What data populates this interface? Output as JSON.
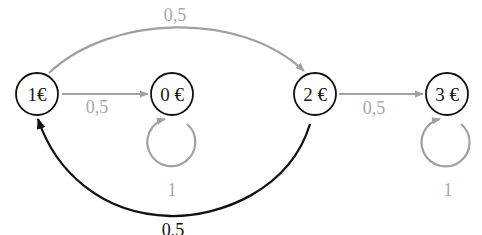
{
  "diagram": {
    "type": "markov-chain",
    "colors": {
      "node_stroke": "#111111",
      "edge_gray": "#a0a0a0",
      "edge_dark": "#111111",
      "label_gray": "#a8a8a8"
    },
    "nodes": [
      {
        "id": "n1",
        "label": "1€"
      },
      {
        "id": "n0",
        "label": "0 €"
      },
      {
        "id": "n2",
        "label": "2 €"
      },
      {
        "id": "n3",
        "label": "3 €"
      }
    ],
    "edges": [
      {
        "from": "1€",
        "to": "2 €",
        "label": "0,5",
        "style": "gray-arc-top"
      },
      {
        "from": "1€",
        "to": "0 €",
        "label": "0,5",
        "style": "gray-straight"
      },
      {
        "from": "0 €",
        "to": "0 €",
        "label": "1",
        "style": "gray-self-loop"
      },
      {
        "from": "2 €",
        "to": "3 €",
        "label": "0,5",
        "style": "gray-straight"
      },
      {
        "from": "3 €",
        "to": "3 €",
        "label": "1",
        "style": "gray-self-loop"
      },
      {
        "from": "2 €",
        "to": "1€",
        "label": "0,5",
        "style": "black-arc-bottom"
      }
    ]
  }
}
